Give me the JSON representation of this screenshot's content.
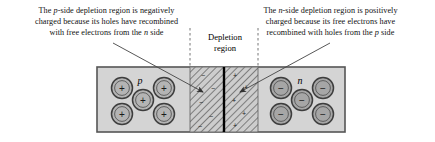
{
  "figure": {
    "background_color": "#ffffff"
  },
  "captions": {
    "left": {
      "line1_a": "The ",
      "line1_italic": "p",
      "line1_b": "-side depletion region is negatively",
      "line2": "charged because its holes have recombined",
      "line3_a": "with free electrons from the ",
      "line3_italic": "n",
      "line3_b": " side"
    },
    "right": {
      "line1_a": "The ",
      "line1_italic": "n",
      "line1_b": "-side depletion region is positively",
      "line2": "charged because its free electrons have",
      "line3_a": "recombined with holes from the ",
      "line3_italic": "p",
      "line3_b": " side"
    }
  },
  "depletion": {
    "line1": "Depletion",
    "line2": "region"
  },
  "regions": {
    "p_label": "p",
    "n_label": "n",
    "p_carrier_sign": "+",
    "n_carrier_sign": "−",
    "p_depletion_sign": "−",
    "n_depletion_sign": "+"
  },
  "colors": {
    "body_fill": "#d4d4d4",
    "ion_fill_p": "#b4b4b4",
    "ion_fill_n": "#a6a6a6",
    "outline": "#555555",
    "junction_line": "#000000",
    "hatch_line": "#3a3a3a",
    "dashed_guide": "#666666",
    "leader_line": "#444444"
  },
  "geometry": {
    "box": {
      "x": 97,
      "y": 67,
      "width": 248,
      "height": 65
    },
    "depletion_band": {
      "x": 190,
      "y": 67,
      "width": 68,
      "height": 65
    },
    "junction_x": 224,
    "dashed_guides_x": [
      190,
      258
    ],
    "p_ion_positions": [
      [
        122,
        88
      ],
      [
        164,
        88
      ],
      [
        143,
        100
      ],
      [
        122,
        114
      ],
      [
        164,
        114
      ]
    ],
    "n_ion_positions": [
      [
        281,
        88
      ],
      [
        323,
        88
      ],
      [
        302,
        100
      ],
      [
        281,
        114
      ],
      [
        323,
        114
      ]
    ],
    "ion_radius": 10.5,
    "depletion_minus_positions": [
      [
        203,
        76
      ],
      [
        212,
        89
      ],
      [
        201,
        103
      ],
      [
        210,
        117
      ],
      [
        200,
        127
      ]
    ],
    "depletion_plus_positions": [
      [
        235,
        76
      ],
      [
        245,
        88
      ],
      [
        233,
        101
      ],
      [
        243,
        114
      ],
      [
        234,
        126
      ]
    ]
  }
}
